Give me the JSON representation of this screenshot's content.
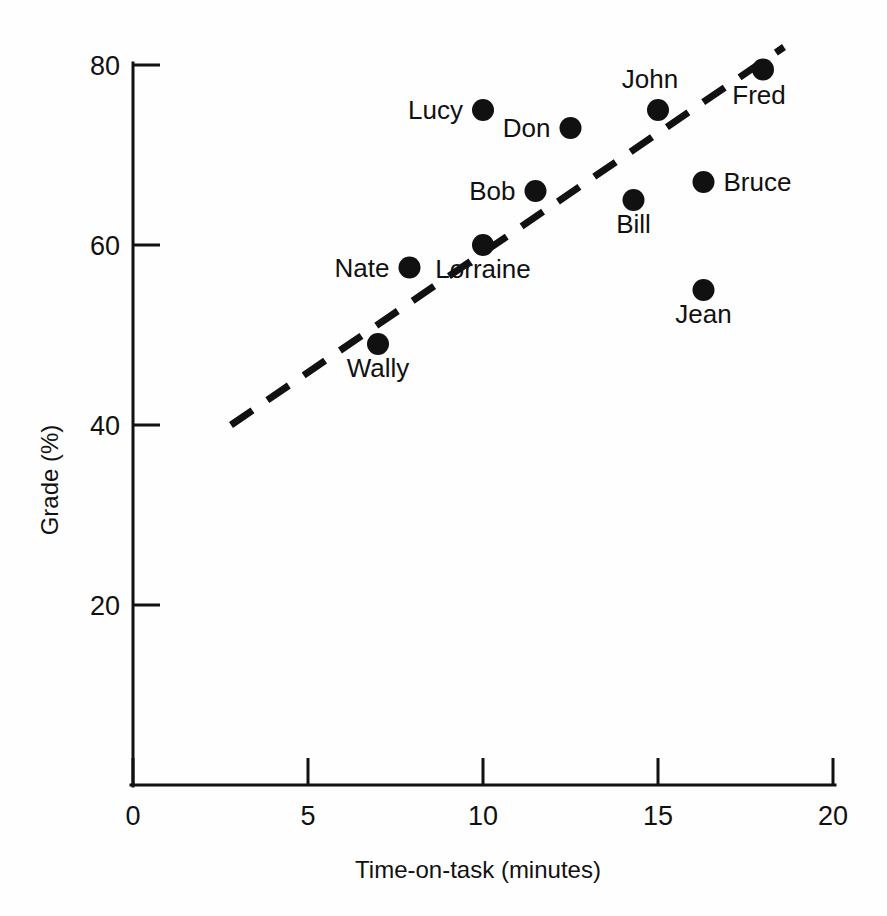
{
  "chart_data": {
    "type": "scatter",
    "title": "",
    "xlabel": "Time-on-task (minutes)",
    "ylabel": "Grade (%)",
    "xlim": [
      0,
      20
    ],
    "ylim": [
      0,
      80
    ],
    "xticks": [
      "0",
      "5",
      "10",
      "15",
      "20"
    ],
    "xtick_values": [
      0,
      5,
      10,
      15,
      20
    ],
    "yticks": [
      "20",
      "40",
      "60",
      "80"
    ],
    "ytick_values": [
      20,
      40,
      60,
      80
    ],
    "grid": false,
    "legend": "none",
    "points": [
      {
        "label": "Wally",
        "x": 7.0,
        "y": 49,
        "label_pos": "below"
      },
      {
        "label": "Nate",
        "x": 7.9,
        "y": 57.5,
        "label_pos": "left"
      },
      {
        "label": "Lucy",
        "x": 10.0,
        "y": 75,
        "label_pos": "left"
      },
      {
        "label": "Lorraine",
        "x": 10.0,
        "y": 60,
        "label_pos": "below"
      },
      {
        "label": "Bob",
        "x": 11.5,
        "y": 66,
        "label_pos": "left"
      },
      {
        "label": "Don",
        "x": 12.5,
        "y": 73,
        "label_pos": "left"
      },
      {
        "label": "Bill",
        "x": 14.3,
        "y": 65,
        "label_pos": "below"
      },
      {
        "label": "John",
        "x": 15.0,
        "y": 75,
        "label_pos": "above"
      },
      {
        "label": "Bruce",
        "x": 16.3,
        "y": 67,
        "label_pos": "right"
      },
      {
        "label": "Jean",
        "x": 16.3,
        "y": 55,
        "label_pos": "below"
      },
      {
        "label": "Fred",
        "x": 18.0,
        "y": 79.5,
        "label_pos": "below-right"
      }
    ],
    "trend_line": {
      "style": "dashed",
      "x_start": 2.8,
      "y_start": 40,
      "x_end": 18.6,
      "y_end": 82
    },
    "colors": {
      "marker": "#111111",
      "axis": "#111111",
      "background": "#ffffff"
    }
  }
}
